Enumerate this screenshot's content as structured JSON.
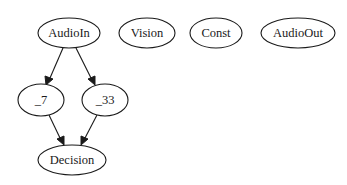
{
  "diagram": {
    "type": "directed-graph",
    "nodes": [
      {
        "id": "AudioIn",
        "label": "AudioIn",
        "cx": 69,
        "cy": 33,
        "rx": 31,
        "ry": 15
      },
      {
        "id": "Vision",
        "label": "Vision",
        "cx": 147,
        "cy": 33,
        "rx": 28,
        "ry": 15
      },
      {
        "id": "Const",
        "label": "Const",
        "cx": 216,
        "cy": 33,
        "rx": 26,
        "ry": 15
      },
      {
        "id": "AudioOut",
        "label": "AudioOut",
        "cx": 298,
        "cy": 33,
        "rx": 37,
        "ry": 15
      },
      {
        "id": "_7",
        "label": "_7",
        "cx": 41,
        "cy": 100,
        "rx": 23,
        "ry": 16
      },
      {
        "id": "_33",
        "label": "_33",
        "cx": 105,
        "cy": 100,
        "rx": 23,
        "ry": 16
      },
      {
        "id": "Decision",
        "label": "Decision",
        "cx": 72,
        "cy": 160,
        "rx": 34,
        "ry": 15
      }
    ],
    "edges": [
      {
        "from": "AudioIn",
        "to": "_7"
      },
      {
        "from": "AudioIn",
        "to": "_33"
      },
      {
        "from": "_7",
        "to": "Decision"
      },
      {
        "from": "_33",
        "to": "Decision"
      }
    ],
    "colors": {
      "stroke": "#1a1a1a",
      "fill": "#ffffff",
      "background": "#ffffff"
    }
  }
}
